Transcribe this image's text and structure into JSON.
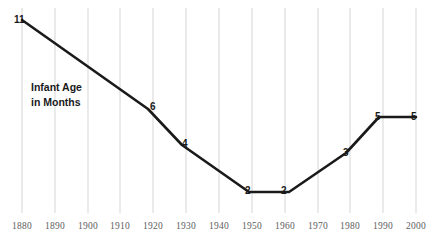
{
  "chart_data": {
    "type": "line",
    "title": "",
    "subtitle": "",
    "xlabel": "",
    "ylabel": "Infant Age in Months",
    "annotation": "Infant Age\nin Months",
    "annotation_line1": "Infant Age",
    "annotation_line2": "in Months",
    "grid": true,
    "grid_orientation": "vertical",
    "legend": "none",
    "xlim": [
      1880,
      2000
    ],
    "ylim": [
      0,
      11
    ],
    "x": [
      1880,
      1920,
      1930,
      1950,
      1960,
      1980,
      1990,
      2000
    ],
    "values": [
      11,
      6,
      4,
      2,
      2,
      3,
      5,
      5
    ],
    "categories": [
      "1880",
      "1920",
      "1930",
      "1950",
      "1960",
      "1980",
      "1990",
      "2000"
    ],
    "point_labels": [
      "11",
      "6",
      "4",
      "2",
      "2",
      "3",
      "5",
      "5"
    ],
    "xticks": [
      "1880",
      "1890",
      "1900",
      "1910",
      "1920",
      "1930",
      "1940",
      "1950",
      "1960",
      "1970",
      "1980",
      "1990",
      "2000"
    ],
    "series": [
      {
        "name": "Infant Age in Months",
        "x": [
          1880,
          1920,
          1930,
          1950,
          1960,
          1980,
          1990,
          2000
        ],
        "values": [
          11,
          6,
          4,
          2,
          2,
          3,
          5,
          5
        ]
      }
    ],
    "colors": {
      "line": "#1a1a1a",
      "grid": "#d5d5d5",
      "tick_text": "#5d5d5d",
      "label_text": "#1a1a1a",
      "background": "#ffffff"
    },
    "geometry": {
      "line_path": "M 22,20 L 148,109 L 182,145 L 249,192 L 289,192 L 346,153 L 379,117 L 416,117",
      "gridline_x": [
        22,
        55,
        88,
        120,
        153,
        186,
        219,
        252,
        285,
        318,
        350,
        383,
        416
      ],
      "gridline_top": 8,
      "gridline_bottom": 213,
      "tick_label_y": 222,
      "point_label_positions": [
        {
          "label": "11",
          "x": 14,
          "y": 15
        },
        {
          "label": "6",
          "x": 150,
          "y": 102
        },
        {
          "label": "4",
          "x": 182,
          "y": 139
        },
        {
          "label": "2",
          "x": 245,
          "y": 186
        },
        {
          "label": "2",
          "x": 281,
          "y": 186
        },
        {
          "label": "3",
          "x": 343,
          "y": 148
        },
        {
          "label": "5",
          "x": 375,
          "y": 112
        },
        {
          "label": "5",
          "x": 411,
          "y": 112
        }
      ]
    }
  }
}
